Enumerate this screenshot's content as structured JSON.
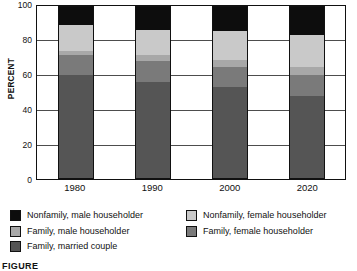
{
  "chart_data": {
    "type": "bar",
    "stacked": true,
    "title": "",
    "subtitle": "",
    "xlabel": "",
    "ylabel": "PERCENT",
    "ylim": [
      0,
      100
    ],
    "yticks": [
      0,
      20,
      40,
      60,
      80,
      100
    ],
    "grid": true,
    "legend_position": "below-plot",
    "categories": [
      "1980",
      "1990",
      "2000",
      "2020"
    ],
    "series": [
      {
        "name": "Family, married couple",
        "color": "#555555",
        "values": [
          60.0,
          56.0,
          53.0,
          48.0
        ]
      },
      {
        "name": "Family, female householder",
        "color": "#7a7a7a",
        "values": [
          11.5,
          12.0,
          12.0,
          12.0
        ]
      },
      {
        "name": "Family, male householder",
        "color": "#a8a8a8",
        "values": [
          2.5,
          3.5,
          4.0,
          4.5
        ]
      },
      {
        "name": "Nonfamily, female householder",
        "color": "#c9c9c9",
        "values": [
          15.0,
          14.5,
          16.5,
          18.5
        ]
      },
      {
        "name": "Nonfamily, male householder",
        "color": "#0d0d0d",
        "values": [
          11.0,
          14.0,
          14.5,
          17.0
        ]
      }
    ],
    "cumulative_tops": {
      "1980": [
        60.0,
        71.5,
        74.0,
        89.0,
        100.0
      ],
      "1990": [
        56.0,
        68.0,
        71.5,
        86.0,
        100.0
      ],
      "2000": [
        53.0,
        65.0,
        69.0,
        85.5,
        100.0
      ],
      "2020": [
        48.0,
        60.0,
        64.5,
        83.0,
        100.0
      ]
    }
  },
  "axis": {
    "ylabel": "PERCENT",
    "yticks": [
      "100",
      "80",
      "60",
      "40",
      "20",
      "0"
    ],
    "xticks": [
      "1980",
      "1990",
      "2000",
      "2020"
    ]
  },
  "legend": {
    "left": [
      {
        "label": "Nonfamily, male householder",
        "color": "#0d0d0d"
      },
      {
        "label": "Family, male householder",
        "color": "#a8a8a8"
      },
      {
        "label": "Family, married couple",
        "color": "#555555"
      }
    ],
    "right": [
      {
        "label": "Nonfamily, female householder",
        "color": "#c9c9c9"
      },
      {
        "label": "Family, female householder",
        "color": "#7a7a7a"
      }
    ]
  },
  "caption": {
    "text": "FIGURE"
  }
}
